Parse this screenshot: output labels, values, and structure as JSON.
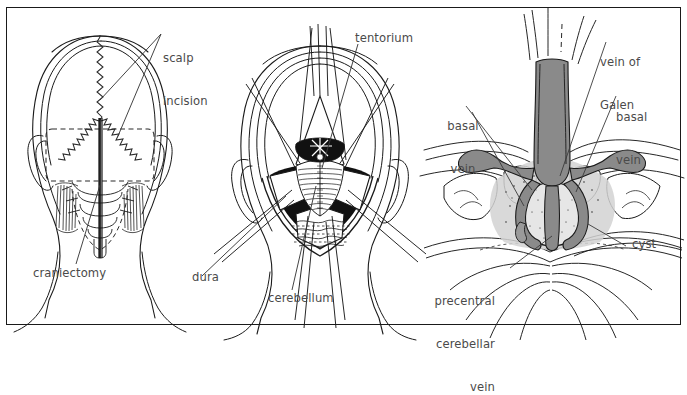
{
  "figure": {
    "type": "medical-illustration",
    "border_color": "#1a1a1a",
    "label_color": "#4a4a4a",
    "background_color": "#ffffff",
    "ink_color": "#1a1a1a",
    "vessel_fill_color": "#8a8a8a",
    "shadow_fill_color": "#111111",
    "stipple_fill_color": "#cfcfcf",
    "panel_count": 3
  },
  "panels": [
    {
      "id": "panel-left",
      "name": "posterior-head-view",
      "description": "Posterior view of head showing scalp incision and craniectomy outline",
      "labels": [
        {
          "id": "scalp-incision",
          "text": "scalp\nincision",
          "line1": "scalp",
          "line2": "incision",
          "x": 163,
          "y": 22,
          "align": "left"
        },
        {
          "id": "craniectomy",
          "text": "craniectomy",
          "x": 33,
          "y": 266,
          "align": "left"
        }
      ]
    },
    {
      "id": "panel-middle",
      "name": "surgical-exposure-view",
      "description": "Operative exposure with retracted dura showing cerebellum and tentorium",
      "labels": [
        {
          "id": "tentorium",
          "text": "tentorium",
          "x": 355,
          "y": 31,
          "align": "left"
        },
        {
          "id": "dura",
          "text": "dura",
          "x": 192,
          "y": 270,
          "align": "left"
        },
        {
          "id": "cerebellum",
          "text": "cerebellum",
          "x": 268,
          "y": 291,
          "align": "left"
        }
      ]
    },
    {
      "id": "panel-right",
      "name": "vein-of-galen-closeup",
      "description": "Magnified view of the vein of Galen complex with cyst",
      "labels": [
        {
          "id": "vein-of-galen",
          "text": "vein of\nGalen",
          "line1": "vein of",
          "line2": "Galen",
          "x": 600,
          "y": 26,
          "align": "left"
        },
        {
          "id": "basal-vein-left",
          "text": "basal\nvein",
          "line1": "basal",
          "line2": "vein",
          "x": 448,
          "y": 90,
          "align": "center"
        },
        {
          "id": "basal-vein-right",
          "text": "basal\nvein",
          "line1": "basal",
          "line2": "vein",
          "x": 616,
          "y": 81,
          "align": "left"
        },
        {
          "id": "precentral-cerebellar-vein",
          "text": "precentral\ncerebellar\nvein",
          "line1": "precentral",
          "line2": "cerebellar",
          "line3": "vein",
          "x": 407,
          "y": 265,
          "align": "right"
        },
        {
          "id": "cyst",
          "text": "cyst",
          "x": 632,
          "y": 237,
          "align": "left"
        }
      ]
    }
  ],
  "anatomical_structures": [
    "scalp incision",
    "craniectomy",
    "dura",
    "cerebellum",
    "tentorium",
    "vein of Galen",
    "basal vein",
    "precentral cerebellar vein",
    "cyst"
  ]
}
